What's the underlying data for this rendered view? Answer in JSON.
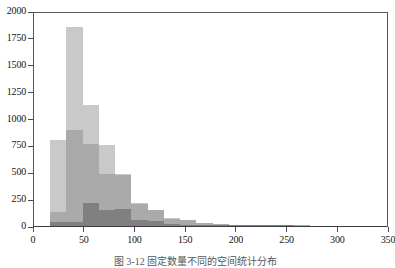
{
  "figure": {
    "caption": "图 3-12  固定数量不同的空间统计分布",
    "background_color": "#ffffff",
    "axis_color": "#4a4a4e"
  },
  "chart_data": {
    "type": "bar",
    "title": "",
    "xlabel": "",
    "ylabel": "",
    "xlim": [
      0,
      350
    ],
    "ylim": [
      0,
      2000
    ],
    "xticks": [
      0,
      50,
      100,
      150,
      200,
      250,
      300,
      350
    ],
    "yticks": [
      0,
      250,
      500,
      750,
      1000,
      1250,
      1500,
      1750,
      2000
    ],
    "grid": false,
    "legend": "none",
    "bin_width": 16,
    "bin_starts": [
      16,
      32,
      48,
      64,
      80,
      96,
      112,
      128,
      144,
      160,
      176,
      192,
      208,
      224,
      240,
      256
    ],
    "series": [
      {
        "name": "light-series",
        "color": "#c9c9c9",
        "values": [
          800,
          1855,
          1130,
          755,
          480,
          210,
          150,
          70,
          55,
          30,
          18,
          10,
          6,
          4,
          2,
          1
        ]
      },
      {
        "name": "medium-series",
        "color": "#aaaaaa",
        "values": [
          130,
          890,
          760,
          480,
          470,
          205,
          145,
          68,
          52,
          28,
          16,
          9,
          5,
          3,
          2,
          1
        ]
      },
      {
        "name": "dark-series",
        "color": "#808080",
        "values": [
          36,
          38,
          215,
          150,
          160,
          55,
          48,
          22,
          14,
          8,
          5,
          3,
          2,
          1,
          1,
          0
        ]
      }
    ]
  }
}
